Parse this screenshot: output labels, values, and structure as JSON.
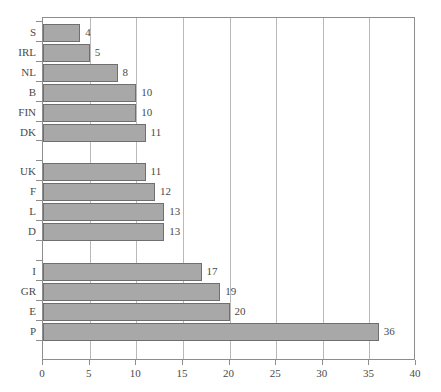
{
  "chart_data": {
    "type": "bar",
    "orientation": "horizontal",
    "title": "",
    "subtitle": "",
    "xlabel": "",
    "ylabel": "",
    "xlim": [
      0,
      40
    ],
    "xticks": [
      0,
      5,
      10,
      15,
      20,
      25,
      30,
      35,
      40
    ],
    "grid": "vertical",
    "legend": null,
    "legend_position": "none",
    "bar_fill_color": "#a8a8a8",
    "bar_border_color": "#6f6f6f",
    "gridline_color": "#b9b9b9",
    "axis_color": "#8d8d8d",
    "text_color": "#4a4a4a",
    "show_value_labels": true,
    "categories": [
      "S",
      "IRL",
      "NL",
      "B",
      "FIN",
      "DK",
      "UK",
      "F",
      "L",
      "D",
      "I",
      "GR",
      "E",
      "P"
    ],
    "values": [
      4,
      5,
      8,
      10,
      10,
      11,
      11,
      12,
      13,
      13,
      17,
      19,
      20,
      36
    ],
    "groups": [
      {
        "categories": [
          "S",
          "IRL",
          "NL",
          "B",
          "FIN",
          "DK"
        ],
        "values": [
          4,
          5,
          8,
          10,
          10,
          11
        ]
      },
      {
        "categories": [
          "UK",
          "F",
          "L",
          "D"
        ],
        "values": [
          11,
          12,
          13,
          13
        ]
      },
      {
        "categories": [
          "I",
          "GR",
          "E",
          "P"
        ],
        "values": [
          17,
          19,
          20,
          36
        ]
      }
    ],
    "slots": [
      {
        "category": "S",
        "value": 4,
        "label": "4",
        "spacer": false
      },
      {
        "category": "IRL",
        "value": 5,
        "label": "5",
        "spacer": false
      },
      {
        "category": "NL",
        "value": 8,
        "label": "8",
        "spacer": false
      },
      {
        "category": "B",
        "value": 10,
        "label": "10",
        "spacer": false
      },
      {
        "category": "FIN",
        "value": 10,
        "label": "10",
        "spacer": false
      },
      {
        "category": "DK",
        "value": 11,
        "label": "11",
        "spacer": false
      },
      {
        "category": "",
        "value": 0,
        "label": "",
        "spacer": true
      },
      {
        "category": "UK",
        "value": 11,
        "label": "11",
        "spacer": false
      },
      {
        "category": "F",
        "value": 12,
        "label": "12",
        "spacer": false
      },
      {
        "category": "L",
        "value": 13,
        "label": "13",
        "spacer": false
      },
      {
        "category": "D",
        "value": 13,
        "label": "13",
        "spacer": false
      },
      {
        "category": "",
        "value": 0,
        "label": "",
        "spacer": true
      },
      {
        "category": "I",
        "value": 17,
        "label": "17",
        "spacer": false
      },
      {
        "category": "GR",
        "value": 19,
        "label": "19",
        "spacer": false
      },
      {
        "category": "E",
        "value": 20,
        "label": "20",
        "spacer": false
      },
      {
        "category": "P",
        "value": 36,
        "label": "36",
        "spacer": false
      }
    ]
  }
}
